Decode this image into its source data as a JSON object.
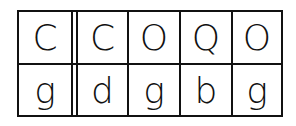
{
  "grid": {
    "top_row": [
      "C",
      "C",
      "O",
      "Q",
      "O"
    ],
    "bottom_row": [
      "g",
      "d",
      "g",
      "b",
      "g"
    ]
  }
}
